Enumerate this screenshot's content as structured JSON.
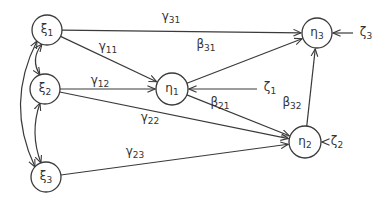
{
  "diagram": {
    "type": "path diagram (structural equation model)",
    "colors": {
      "stroke": "#3a3a3a",
      "text": "#333333",
      "background": "#ffffff"
    },
    "nodes": [
      {
        "id": "xi1",
        "symbol": "ξ",
        "sub": "1",
        "x": 47,
        "y": 30,
        "r": 15
      },
      {
        "id": "xi2",
        "symbol": "ξ",
        "sub": "2",
        "x": 45,
        "y": 89,
        "r": 15
      },
      {
        "id": "xi3",
        "symbol": "ξ",
        "sub": "3",
        "x": 46,
        "y": 177,
        "r": 15
      },
      {
        "id": "eta1",
        "symbol": "η",
        "sub": "1",
        "x": 172,
        "y": 89,
        "r": 16
      },
      {
        "id": "eta2",
        "symbol": "η",
        "sub": "2",
        "x": 305,
        "y": 142,
        "r": 16
      },
      {
        "id": "eta3",
        "symbol": "η",
        "sub": "3",
        "x": 317,
        "y": 33,
        "r": 15
      }
    ],
    "disturbances": [
      {
        "id": "zeta1",
        "symbol": "ζ",
        "sub": "1",
        "x": 267,
        "y": 89,
        "target": "eta1"
      },
      {
        "id": "zeta2",
        "symbol": "ζ",
        "sub": "2",
        "x": 334,
        "y": 143,
        "target": "eta2"
      },
      {
        "id": "zeta3",
        "symbol": "ζ",
        "sub": "3",
        "x": 363,
        "y": 34,
        "target": "eta3"
      }
    ],
    "edges": [
      {
        "from": "xi1",
        "to": "eta3",
        "symbol": "γ",
        "sub": "31",
        "lx": 171,
        "ly": 20
      },
      {
        "from": "xi1",
        "to": "eta1",
        "symbol": "γ",
        "sub": "11",
        "lx": 108,
        "ly": 50
      },
      {
        "from": "xi2",
        "to": "eta1",
        "symbol": "γ",
        "sub": "12",
        "lx": 100,
        "ly": 84
      },
      {
        "from": "xi2",
        "to": "eta2",
        "symbol": "γ",
        "sub": "22",
        "lx": 150,
        "ly": 121
      },
      {
        "from": "xi3",
        "to": "eta2",
        "symbol": "γ",
        "sub": "23",
        "lx": 135,
        "ly": 155
      },
      {
        "from": "eta1",
        "to": "eta3",
        "symbol": "β",
        "sub": "31",
        "lx": 206,
        "ly": 48
      },
      {
        "from": "eta1",
        "to": "eta2",
        "symbol": "β",
        "sub": "21",
        "lx": 220,
        "ly": 106
      },
      {
        "from": "eta2",
        "to": "eta3",
        "symbol": "β",
        "sub": "32",
        "lx": 292,
        "ly": 106
      }
    ],
    "correlations": [
      {
        "a": "xi1",
        "b": "xi2"
      },
      {
        "a": "xi2",
        "b": "xi3"
      },
      {
        "a": "xi1",
        "b": "xi3"
      }
    ]
  }
}
